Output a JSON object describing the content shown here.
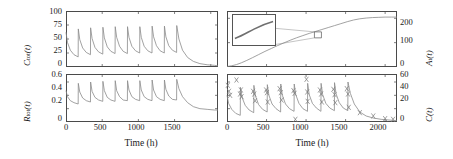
{
  "figure": {
    "width": 453,
    "height": 159,
    "line_color": "#8a8a8a",
    "axis_color": "#4a4a4a",
    "marker_color": "#7d7d7d",
    "inset_border_color": "#555555"
  },
  "panels": {
    "top_left": {
      "ylabel_main": "C",
      "ylabel_sub": "tot",
      "ylabel_arg": "(t)",
      "yticks": [
        "100",
        "75",
        "50",
        "25",
        "0"
      ],
      "ylim": [
        0,
        100
      ],
      "xlim": [
        0,
        2100
      ],
      "xticks_values": [
        0,
        500,
        1000,
        1500,
        2000
      ]
    },
    "bottom_left": {
      "ylabel_main": "R",
      "ylabel_sub": "tot",
      "ylabel_arg": "(t)",
      "yticks": [
        "0.6",
        "0.4",
        "0.2",
        "0"
      ],
      "ylim": [
        0,
        0.72
      ],
      "xlim": [
        0,
        2100
      ],
      "xticks": [
        "0",
        "500",
        "1000",
        "1500"
      ],
      "xticks_values": [
        0,
        500,
        1000,
        1500
      ],
      "xlabel": "Time (h)"
    },
    "top_right": {
      "ylabel_main": "A",
      "ylabel_sub": "t",
      "ylabel_arg": "(t)",
      "yticks": [
        "200",
        "100",
        "0"
      ],
      "ylim": [
        0,
        230
      ],
      "xlim": [
        0,
        2150
      ],
      "xticks_values": [
        0,
        500,
        1000,
        1500,
        2000
      ],
      "has_inset": true
    },
    "bottom_right": {
      "ylabel_main": "C",
      "ylabel_arg": "(t)",
      "yticks": [
        "60",
        "40",
        "20",
        "0"
      ],
      "ylim": [
        0,
        72
      ],
      "xlim": [
        0,
        2150
      ],
      "xticks": [
        "0",
        "500",
        "1000",
        "1500",
        "2000"
      ],
      "xticks_values": [
        0,
        500,
        1000,
        1500,
        2000
      ],
      "xlabel": "Time (h)"
    }
  },
  "chart_data": [
    {
      "id": "top_left",
      "type": "line",
      "title": "",
      "xlabel": "Time (h)",
      "ylabel": "C_tot(t)",
      "xlim": [
        0,
        2100
      ],
      "ylim": [
        0,
        100
      ],
      "xticks": [
        0,
        500,
        1000,
        1500,
        2000
      ],
      "yticks": [
        0,
        25,
        50,
        75,
        100
      ],
      "grid": false,
      "description": "Total drug concentration showing repeated dosing sawtooth: each dose spikes the level which then decays exponentially; after the last dose near 1500 h the curve decays to baseline.",
      "dose_times": [
        0,
        170,
        340,
        510,
        680,
        850,
        1020,
        1190,
        1360,
        1530
      ],
      "peak_values": [
        62,
        68,
        70,
        71,
        72,
        72,
        72,
        73,
        73,
        74
      ],
      "trough_values": [
        18,
        22,
        23,
        24,
        24,
        25,
        25,
        25,
        26,
        2
      ],
      "series": [
        {
          "name": "C_tot",
          "x": [
            0,
            20,
            60,
            110,
            168,
            170,
            190,
            230,
            280,
            338,
            340,
            360,
            400,
            450,
            508,
            510,
            530,
            570,
            620,
            678,
            680,
            700,
            740,
            790,
            848,
            850,
            870,
            910,
            960,
            1018,
            1020,
            1040,
            1080,
            1130,
            1188,
            1190,
            1210,
            1250,
            1300,
            1358,
            1360,
            1380,
            1420,
            1470,
            1528,
            1530,
            1560,
            1610,
            1680,
            1760,
            1850,
            1950,
            2050,
            2100
          ],
          "y": [
            62,
            44,
            30,
            22,
            18,
            68,
            49,
            34,
            26,
            22,
            70,
            51,
            35,
            27,
            23,
            71,
            52,
            36,
            28,
            24,
            72,
            53,
            37,
            28,
            24,
            72,
            53,
            37,
            29,
            25,
            72,
            53,
            37,
            29,
            25,
            73,
            54,
            38,
            29,
            25,
            73,
            54,
            38,
            30,
            26,
            74,
            50,
            30,
            17,
            10,
            6,
            4,
            3,
            2
          ]
        }
      ]
    },
    {
      "id": "bottom_left",
      "type": "line",
      "title": "",
      "xlabel": "Time (h)",
      "ylabel": "R_tot(t)",
      "xlim": [
        0,
        2100
      ],
      "ylim": [
        0,
        0.72
      ],
      "xticks": [
        0,
        500,
        1000,
        1500
      ],
      "yticks": [
        0,
        0.2,
        0.4,
        0.6
      ],
      "grid": false,
      "description": "Total receptor level with the same dosing rhythm: sharp rise after each dose then exponential decay; final relaxation to a low plateau near 0.18 after the last dose.",
      "dose_times": [
        0,
        170,
        340,
        510,
        680,
        850,
        1020,
        1190,
        1360,
        1530
      ],
      "peak_values": [
        0.47,
        0.58,
        0.6,
        0.61,
        0.62,
        0.62,
        0.62,
        0.63,
        0.63,
        0.64
      ],
      "trough_values": [
        0.27,
        0.3,
        0.31,
        0.31,
        0.32,
        0.32,
        0.32,
        0.32,
        0.33,
        0.18
      ],
      "series": [
        {
          "name": "R_tot",
          "x": [
            0,
            20,
            60,
            110,
            168,
            170,
            190,
            230,
            280,
            338,
            340,
            360,
            400,
            450,
            508,
            510,
            530,
            570,
            620,
            678,
            680,
            700,
            740,
            790,
            848,
            850,
            870,
            910,
            960,
            1018,
            1020,
            1040,
            1080,
            1130,
            1188,
            1190,
            1210,
            1250,
            1300,
            1358,
            1360,
            1380,
            1420,
            1470,
            1528,
            1530,
            1560,
            1610,
            1680,
            1760,
            1850,
            1950,
            2050,
            2100
          ],
          "y": [
            0.47,
            0.38,
            0.32,
            0.29,
            0.27,
            0.58,
            0.45,
            0.36,
            0.32,
            0.3,
            0.6,
            0.46,
            0.37,
            0.33,
            0.31,
            0.61,
            0.47,
            0.37,
            0.33,
            0.31,
            0.62,
            0.47,
            0.38,
            0.33,
            0.32,
            0.62,
            0.48,
            0.38,
            0.34,
            0.32,
            0.62,
            0.48,
            0.38,
            0.34,
            0.32,
            0.63,
            0.48,
            0.38,
            0.34,
            0.32,
            0.63,
            0.49,
            0.39,
            0.34,
            0.33,
            0.64,
            0.5,
            0.38,
            0.29,
            0.23,
            0.2,
            0.19,
            0.18,
            0.18
          ]
        }
      ]
    },
    {
      "id": "top_right",
      "type": "line",
      "title": "",
      "xlabel": "Time (h)",
      "ylabel": "A_t(t)",
      "xlim": [
        0,
        2150
      ],
      "ylim": [
        0,
        230
      ],
      "xticks": [
        0,
        500,
        1000,
        1500,
        2000
      ],
      "yticks": [
        0,
        100,
        200
      ],
      "grid": false,
      "description": "Target amount A_t(t) rises as a smooth sigmoid from near 0 to a plateau of about 200; an inset magnifies the nearly-linear mid-section around t = 1150 h where small ripples from the dosing cycle are visible.",
      "inset": {
        "source_marker": true,
        "source_x": 1150,
        "source_y": 132,
        "magnified_feature": "slightly rippled upward-sloping segment"
      },
      "series": [
        {
          "name": "A_t",
          "x": [
            0,
            60,
            120,
            180,
            250,
            320,
            400,
            480,
            560,
            640,
            720,
            800,
            880,
            960,
            1040,
            1120,
            1200,
            1280,
            1360,
            1440,
            1520,
            1600,
            1680,
            1760,
            1840,
            1920,
            2000,
            2080,
            2150
          ],
          "y": [
            2,
            5,
            10,
            17,
            27,
            38,
            51,
            64,
            76,
            88,
            99,
            110,
            120,
            129,
            138,
            146,
            154,
            162,
            170,
            178,
            186,
            193,
            198,
            201,
            203,
            204,
            205,
            205,
            205
          ]
        }
      ]
    },
    {
      "id": "bottom_right",
      "type": "line",
      "title": "",
      "xlabel": "Time (h)",
      "ylabel": "C(t)",
      "xlim": [
        0,
        2150
      ],
      "ylim": [
        0,
        72
      ],
      "xticks": [
        0,
        500,
        1000,
        1500,
        2000
      ],
      "yticks": [
        0,
        20,
        40,
        60
      ],
      "grid": false,
      "description": "Free drug concentration C(t): model curve with sawtooth dosing peaks overlaid with measured data points drawn as x markers. After the final dose near 1500 h the concentration decays toward zero and the late data points follow the tail.",
      "series": [
        {
          "name": "C model",
          "x": [
            0,
            20,
            60,
            110,
            168,
            170,
            190,
            230,
            280,
            338,
            340,
            360,
            400,
            450,
            508,
            510,
            530,
            570,
            620,
            678,
            680,
            700,
            740,
            790,
            848,
            850,
            870,
            910,
            960,
            1018,
            1020,
            1040,
            1080,
            1130,
            1188,
            1190,
            1210,
            1250,
            1300,
            1358,
            1360,
            1380,
            1420,
            1470,
            1528,
            1530,
            1560,
            1610,
            1680,
            1760,
            1850,
            1950,
            2050,
            2150
          ],
          "y": [
            40,
            28,
            19,
            13,
            10,
            52,
            37,
            25,
            18,
            14,
            55,
            39,
            26,
            19,
            15,
            56,
            40,
            27,
            20,
            15,
            57,
            40,
            27,
            20,
            16,
            57,
            41,
            28,
            20,
            16,
            58,
            41,
            28,
            21,
            16,
            58,
            41,
            28,
            21,
            17,
            59,
            42,
            29,
            21,
            17,
            60,
            43,
            27,
            15,
            9,
            6,
            4,
            3,
            2
          ]
        }
      ],
      "scatter": {
        "name": "C data",
        "marker": "x",
        "x": [
          10,
          25,
          40,
          120,
          165,
          175,
          185,
          330,
          345,
          355,
          495,
          505,
          515,
          665,
          680,
          690,
          840,
          855,
          865,
          1005,
          1015,
          1020,
          1175,
          1190,
          1200,
          1345,
          1360,
          1370,
          1515,
          1530,
          1540,
          1680,
          1850,
          2000,
          2100
        ],
        "y": [
          55,
          46,
          40,
          63,
          42,
          48,
          38,
          46,
          42,
          32,
          48,
          44,
          30,
          50,
          44,
          33,
          47,
          43,
          4,
          64,
          45,
          31,
          48,
          42,
          30,
          49,
          41,
          29,
          50,
          42,
          22,
          14,
          9,
          5,
          4
        ]
      }
    }
  ]
}
